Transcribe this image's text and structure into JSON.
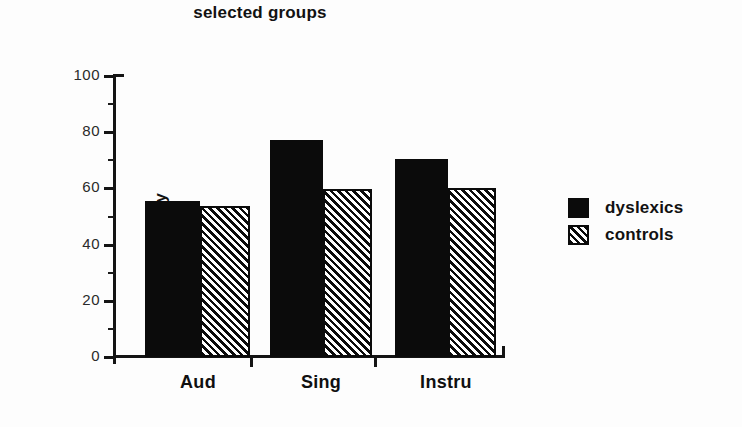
{
  "chart_data": {
    "type": "bar",
    "title": "selected groups",
    "xlabel": "",
    "ylabel": "mean % of melody",
    "categories": [
      "Aud",
      "Sing",
      "Instru"
    ],
    "series": [
      {
        "name": "dyslexics",
        "values": [
          55.5,
          77.2,
          70.5
        ],
        "fill": "solid"
      },
      {
        "name": "controls",
        "values": [
          53.7,
          59.8,
          60.2
        ],
        "fill": "hatched"
      }
    ],
    "ylim": [
      0,
      100
    ],
    "y_major_ticks": [
      0,
      20,
      40,
      60,
      80,
      100
    ],
    "y_minor_ticks": [
      10,
      30,
      50,
      70,
      90
    ],
    "y_tick_labels": [
      "0",
      "20",
      "40",
      "60",
      "80",
      "100"
    ],
    "grid": false,
    "legend_position": "right",
    "legend": [
      {
        "label": "dyslexics",
        "swatch": "solid-black-square"
      },
      {
        "label": "controls",
        "swatch": "hatched-diagonal-square"
      }
    ]
  },
  "colors": {
    "ink": "#0b0b0b",
    "background": "#fdfdfd",
    "tick_label": "#2a2a2a"
  }
}
